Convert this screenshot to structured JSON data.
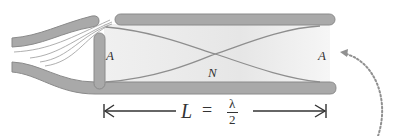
{
  "diagram": {
    "labels": {
      "antinode_left": "A",
      "node_center": "N",
      "antinode_right": "A",
      "length_symbol": "L",
      "equals": "=",
      "numerator": "λ",
      "denominator": "2"
    },
    "colors": {
      "pipe_fill": "#a9a9a9",
      "pipe_stroke": "#8a8a8a",
      "interior": "#ececec",
      "wave": "#8e8e8e",
      "airflow": "#9a9a9a",
      "text": "#333333",
      "dotted_arrow": "#909090"
    }
  }
}
